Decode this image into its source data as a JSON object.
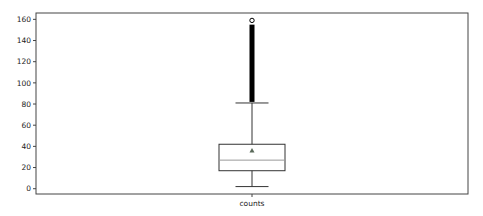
{
  "chart_data": {
    "type": "boxplot",
    "title": "",
    "xlabel": "",
    "ylabel": "",
    "categories": [
      "counts"
    ],
    "ylim": [
      -5,
      166
    ],
    "yticks": [
      0,
      20,
      40,
      60,
      80,
      100,
      120,
      140,
      160
    ],
    "grid": false,
    "legend": "none",
    "series": [
      {
        "name": "counts",
        "whisker_low": 2,
        "q1": 17,
        "median": 27,
        "q3": 42,
        "whisker_high": 81,
        "mean": 36,
        "outliers_range": [
          82,
          155
        ],
        "outliers_extra": [
          159
        ]
      }
    ],
    "colors": {
      "box": "#333333",
      "median": "#9a9a9a",
      "mean": "#5a6a5a",
      "outlier": "#000000"
    }
  }
}
